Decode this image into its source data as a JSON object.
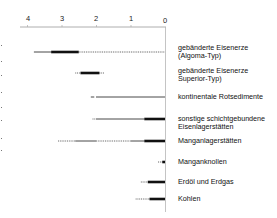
{
  "chart_data": {
    "type": "range-bar",
    "title": "",
    "xlabel": "",
    "ylabel": "",
    "x_axis": {
      "ticks": [
        "4",
        "3",
        "2",
        "1",
        "0"
      ],
      "range": [
        4,
        0
      ],
      "reversed": true,
      "position": "top"
    },
    "grid": false,
    "legend": null,
    "line_styles": {
      "thick": "main occurrence",
      "thin": "occurrence",
      "dotted": "minor occurrence"
    },
    "series": [
      {
        "name": "gebänderte Eisenerze (Algoma-Typ)",
        "label_lines": [
          "gebänderte Eisenerze",
          "(Algoma-Typ)"
        ],
        "segments": [
          {
            "from": 3.8,
            "to": 3.3,
            "style": "thin"
          },
          {
            "from": 3.3,
            "to": 2.5,
            "style": "thick"
          },
          {
            "from": 2.5,
            "to": 0.0,
            "style": "dotted"
          }
        ]
      },
      {
        "name": "gebänderte Eisenerze Superior-Typ)",
        "label_lines": [
          "gebänderte Eisenerze",
          "Superior-Typ)"
        ],
        "segments": [
          {
            "from": 2.6,
            "to": 2.45,
            "style": "dotted"
          },
          {
            "from": 2.45,
            "to": 1.9,
            "style": "thick"
          },
          {
            "from": 1.9,
            "to": 1.75,
            "style": "dotted"
          }
        ]
      },
      {
        "name": "kontinentale Rotsedimente",
        "label_lines": [
          "kontinentale Rotsedimente"
        ],
        "segments": [
          {
            "from": 2.15,
            "to": 2.05,
            "style": "thin"
          },
          {
            "from": 2.0,
            "to": 0.0,
            "style": "thin"
          }
        ]
      },
      {
        "name": "sonstige schichtgebundene Eisenlagerstätten",
        "label_lines": [
          "sonstige schichtgebundene",
          "Eisenlagerstätten"
        ],
        "segments": [
          {
            "from": 2.1,
            "to": 2.0,
            "style": "dotted"
          },
          {
            "from": 2.0,
            "to": 0.6,
            "style": "thin"
          },
          {
            "from": 0.6,
            "to": 0.0,
            "style": "thick"
          }
        ]
      },
      {
        "name": "Manganlagerstätten",
        "label_lines": [
          "Manganlagerstätten"
        ],
        "segments": [
          {
            "from": 3.1,
            "to": 2.6,
            "style": "dotted"
          },
          {
            "from": 2.6,
            "to": 2.0,
            "style": "thin"
          },
          {
            "from": 2.0,
            "to": 1.0,
            "style": "dotted"
          },
          {
            "from": 1.0,
            "to": 0.6,
            "style": "thin"
          },
          {
            "from": 0.6,
            "to": 0.0,
            "style": "thick"
          }
        ]
      },
      {
        "name": "Manganknollen",
        "label_lines": [
          "Manganknollen"
        ],
        "segments": [
          {
            "from": 0.2,
            "to": 0.08,
            "style": "dotted"
          },
          {
            "from": 0.08,
            "to": 0.0,
            "style": "thick"
          }
        ]
      },
      {
        "name": "Erdöl und Erdgas",
        "label_lines": [
          "Erdöl und Erdgas"
        ],
        "segments": [
          {
            "from": 0.7,
            "to": 0.5,
            "style": "dotted"
          },
          {
            "from": 0.5,
            "to": 0.0,
            "style": "thick"
          }
        ]
      },
      {
        "name": "Kohlen",
        "label_lines": [
          "Kohlen"
        ],
        "segments": [
          {
            "from": 0.85,
            "to": 0.45,
            "style": "dotted"
          },
          {
            "from": 0.45,
            "to": 0.0,
            "style": "thick"
          }
        ]
      }
    ]
  },
  "labels": {
    "ticks": [
      "4",
      "3",
      "2",
      "1",
      "0"
    ],
    "row0": [
      "gebänderte Eisenerze",
      "(Algoma-Typ)"
    ],
    "row1": [
      "gebänderte Eisenerze",
      "Superior-Typ)"
    ],
    "row2": [
      "kontinentale Rotsedimente"
    ],
    "row3": [
      "sonstige schichtgebundene",
      "Eisenlagerstätten"
    ],
    "row4": [
      "Manganlagerstätten"
    ],
    "row5": [
      "Manganknollen"
    ],
    "row6": [
      "Erdöl und Erdgas"
    ],
    "row7": [
      "Kohlen"
    ]
  },
  "colors": {
    "ink": "#111111",
    "axis": "#8a8a8a",
    "background": "#ffffff"
  }
}
